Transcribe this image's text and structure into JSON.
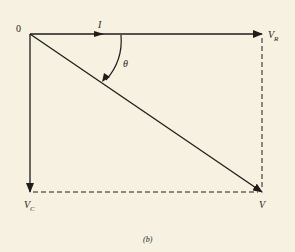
{
  "diagram": {
    "type": "phasor-diagram",
    "caption": "(b)",
    "origin_label": "0",
    "labels": {
      "current": "I",
      "resistor_voltage_main": "V",
      "resistor_voltage_sub": "R",
      "capacitor_voltage_main": "V",
      "capacitor_voltage_sub": "C",
      "total_voltage": "V",
      "angle": "θ"
    },
    "vectors": [
      {
        "name": "V_R",
        "from": [
          30,
          34
        ],
        "to": [
          262,
          34
        ],
        "style": "solid",
        "arrow": true
      },
      {
        "name": "V_C",
        "from": [
          30,
          34
        ],
        "to": [
          30,
          192
        ],
        "style": "solid",
        "arrow": true
      },
      {
        "name": "V",
        "from": [
          30,
          34
        ],
        "to": [
          262,
          192
        ],
        "style": "solid",
        "arrow": true
      }
    ],
    "guides": [
      {
        "from": [
          262,
          38
        ],
        "to": [
          262,
          192
        ],
        "style": "dashed"
      },
      {
        "from": [
          30,
          192
        ],
        "to": [
          262,
          192
        ],
        "style": "dashed"
      }
    ],
    "colors": {
      "background": "#f6f1e1",
      "ink": "#1f1d1a"
    }
  }
}
